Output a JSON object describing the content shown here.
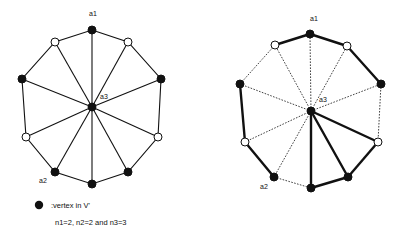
{
  "diagram": {
    "colors": {
      "ink": "#111111",
      "background": "#ffffff",
      "open_node_fill": "#ffffff"
    },
    "left_graph": {
      "nodes": [
        {
          "id": "top",
          "x": 92,
          "y": 30,
          "filled": true,
          "label": "a1"
        },
        {
          "id": "ul",
          "x": 55,
          "y": 42,
          "filled": false
        },
        {
          "id": "ur",
          "x": 128,
          "y": 42,
          "filled": false
        },
        {
          "id": "l",
          "x": 22,
          "y": 79,
          "filled": true
        },
        {
          "id": "r",
          "x": 161,
          "y": 79,
          "filled": true
        },
        {
          "id": "ll",
          "x": 26,
          "y": 137,
          "filled": false
        },
        {
          "id": "lr",
          "x": 158,
          "y": 137,
          "filled": false
        },
        {
          "id": "bl",
          "x": 55,
          "y": 172,
          "filled": true,
          "label": "a2"
        },
        {
          "id": "br",
          "x": 128,
          "y": 172,
          "filled": true
        },
        {
          "id": "b",
          "x": 92,
          "y": 184,
          "filled": true
        },
        {
          "id": "c",
          "x": 92,
          "y": 107,
          "filled": true,
          "label": "a3"
        }
      ],
      "labels": [
        {
          "text": "a1",
          "x": 89,
          "y": 16
        },
        {
          "text": "a3",
          "x": 100,
          "y": 99
        },
        {
          "text": "a2",
          "x": 39,
          "y": 183
        }
      ]
    },
    "right_graph": {
      "nodes": [
        {
          "id": "top",
          "x": 310,
          "y": 34,
          "filled": true,
          "label": "a1"
        },
        {
          "id": "ul",
          "x": 275,
          "y": 45,
          "filled": false
        },
        {
          "id": "ur",
          "x": 347,
          "y": 46,
          "filled": false
        },
        {
          "id": "l",
          "x": 240,
          "y": 84,
          "filled": true
        },
        {
          "id": "r",
          "x": 381,
          "y": 84,
          "filled": true
        },
        {
          "id": "ll",
          "x": 245,
          "y": 142,
          "filled": false
        },
        {
          "id": "lr",
          "x": 378,
          "y": 142,
          "filled": false
        },
        {
          "id": "bl",
          "x": 274,
          "y": 177,
          "filled": true,
          "label": "a2"
        },
        {
          "id": "br",
          "x": 348,
          "y": 177,
          "filled": true
        },
        {
          "id": "b",
          "x": 311,
          "y": 188,
          "filled": true
        },
        {
          "id": "c",
          "x": 311,
          "y": 111,
          "filled": true,
          "label": "a3"
        }
      ],
      "labels": [
        {
          "text": "a1",
          "x": 310,
          "y": 21
        },
        {
          "text": "a3",
          "x": 319,
          "y": 102
        },
        {
          "text": "a2",
          "x": 260,
          "y": 189
        }
      ],
      "thick_edges": [
        "ul-top",
        "top-ur",
        "ur-r",
        "l-ll",
        "ll-bl",
        "b-br",
        "br-lr",
        "c-b",
        "c-br",
        "c-lr"
      ],
      "dashed_edges": [
        "ul-l",
        "r-lr",
        "bl-b",
        "c-top",
        "c-ul",
        "c-ur",
        "c-l",
        "c-r",
        "c-ll",
        "c-bl"
      ]
    },
    "legend": {
      "marker": "filled-circle",
      "marker_text": ":vertex in V'",
      "caption": "n1=2, n2=2 and n3=3"
    }
  }
}
